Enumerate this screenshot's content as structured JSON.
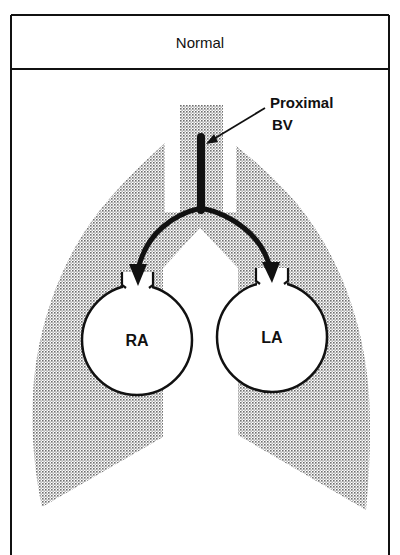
{
  "header": {
    "title": "Normal"
  },
  "annotation": {
    "line1": "Proximal",
    "line2": "BV"
  },
  "chambers": {
    "right_atrium": "RA",
    "left_atrium": "LA"
  },
  "colors": {
    "ink": "#111111",
    "stipple": "#8a8a8a",
    "background": "#ffffff"
  }
}
